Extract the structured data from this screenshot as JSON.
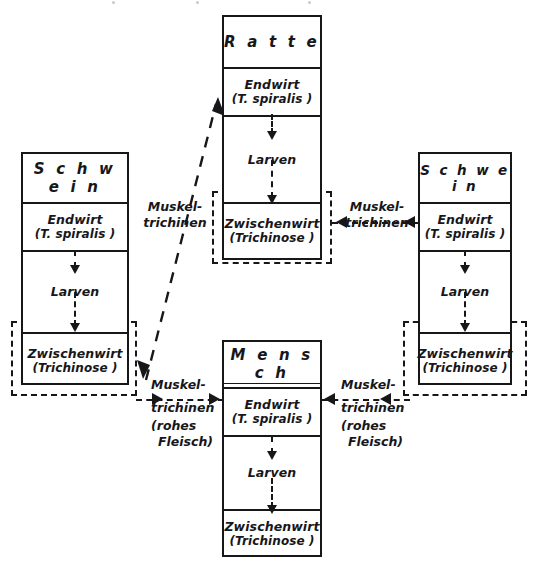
{
  "diagram": {
    "type": "life-cycle-flow",
    "language": "de",
    "topic": "Trichinella spiralis Lebenszyklus",
    "stage_labels": {
      "endwirt": "Endwirt",
      "endwirt_sub": "(T. spiralis )",
      "larven": "Larven",
      "zwischenwirt": "Zwischenwirt",
      "zwischenwirt_sub": "(Trichinose )"
    },
    "hosts": [
      {
        "id": "schwein-left",
        "title": "S c h w e i n",
        "title_plain": "Schwein",
        "underlined": false,
        "cells": [
          "Endwirt",
          "Larven",
          "Zwischenwirt"
        ]
      },
      {
        "id": "ratte",
        "title": "R a t t e",
        "title_plain": "Ratte",
        "underlined": false,
        "cells": [
          "Endwirt",
          "Larven",
          "Zwischenwirt"
        ]
      },
      {
        "id": "schwein-right",
        "title": "S c h w e i n",
        "title_plain": "Schwein",
        "underlined": false,
        "cells": [
          "Endwirt",
          "Larven",
          "Zwischenwirt"
        ]
      },
      {
        "id": "mensch",
        "title": "M e n s c h",
        "title_plain": "Mensch",
        "underlined": true,
        "cells": [
          "Endwirt",
          "Larven",
          "Zwischenwirt"
        ]
      }
    ],
    "edges": [
      {
        "id": "edge-schwein-left-to-ratte",
        "from": "schwein-left",
        "to": "ratte",
        "style": "dashed-diagonal",
        "heads": "both",
        "label_lines": [
          "Muskel-",
          "trichinen"
        ]
      },
      {
        "id": "edge-schwein-right-to-ratte",
        "from": "schwein-right",
        "to": "ratte",
        "style": "dashed-horizontal",
        "direction": "left",
        "label_lines": [
          "Muskel-",
          "trichinen"
        ]
      },
      {
        "id": "edge-schwein-left-to-mensch",
        "from": "schwein-left",
        "to": "mensch",
        "style": "dashed-horizontal",
        "direction": "right",
        "label_lines": [
          "Muskel-",
          "trichinen",
          "(rohes",
          "Fleisch)"
        ]
      },
      {
        "id": "edge-schwein-right-to-mensch",
        "from": "schwein-right",
        "to": "mensch",
        "style": "dashed-horizontal",
        "direction": "left",
        "label_lines": [
          "Muskel-",
          "trichinen",
          "(rohes",
          "Fleisch)"
        ]
      }
    ],
    "colors": {
      "ink": "#17171a",
      "paper": "#ffffff"
    }
  }
}
